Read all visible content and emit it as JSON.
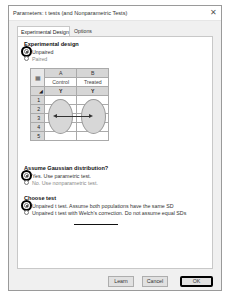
{
  "window": {
    "title": "Parameters: t tests (and Nonparametric Tests)",
    "close_icon": "close-icon"
  },
  "tabs": [
    {
      "label": "Experimental Design",
      "active": true
    },
    {
      "label": "Options",
      "active": false
    }
  ],
  "experimental_design": {
    "heading": "Experimental design",
    "options": [
      {
        "label": "Unpaired",
        "checked": true
      },
      {
        "label": "Paired",
        "checked": false
      }
    ],
    "table": {
      "columns": [
        {
          "letter": "A",
          "name": "Control",
          "y": "Y"
        },
        {
          "letter": "B",
          "name": "Treated",
          "y": "Y"
        }
      ],
      "rows": [
        "1",
        "2",
        "3",
        "4",
        "5"
      ]
    }
  },
  "gaussian": {
    "heading": "Assume Gaussian distribution?",
    "options": [
      {
        "label": "Yes. Use parametric test.",
        "checked": true
      },
      {
        "label": "No. Use nonparametric test.",
        "checked": false
      }
    ]
  },
  "choose_test": {
    "heading": "Choose test",
    "options": [
      {
        "label": "Unpaired t test. Assume both populations have the same SD",
        "checked": true
      },
      {
        "label": "Unpaired t test with Welch's correction. Do not assume equal SDs",
        "checked": false
      }
    ]
  },
  "buttons": {
    "learn": "Learn",
    "cancel": "Cancel",
    "ok": "OK"
  }
}
